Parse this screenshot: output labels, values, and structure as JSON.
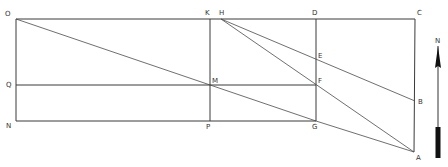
{
  "diagram": {
    "type": "geometric survey diagram",
    "colors": {
      "line": "#3a3a3a",
      "label": "#333333",
      "background": "#ffffff",
      "arrow": "#111111"
    },
    "points": {
      "O": {
        "label": "O",
        "x": 16,
        "y": 19
      },
      "K": {
        "label": "K",
        "x": 210,
        "y": 19
      },
      "H": {
        "label": "H",
        "x": 221,
        "y": 19
      },
      "D": {
        "label": "D",
        "x": 316,
        "y": 19
      },
      "C": {
        "label": "C",
        "x": 415,
        "y": 19
      },
      "E": {
        "label": "E",
        "x": 316,
        "y": 60
      },
      "Q": {
        "label": "Q",
        "x": 16,
        "y": 85
      },
      "M": {
        "label": "M",
        "x": 210,
        "y": 85
      },
      "F": {
        "label": "F",
        "x": 316,
        "y": 85
      },
      "B": {
        "label": "B",
        "x": 415,
        "y": 101
      },
      "N": {
        "label": "N",
        "x": 16,
        "y": 121
      },
      "P": {
        "label": "P",
        "x": 210,
        "y": 121
      },
      "G": {
        "label": "G",
        "x": 316,
        "y": 121
      },
      "A": {
        "label": "A",
        "x": 414,
        "y": 152
      }
    },
    "segments": [
      [
        "O",
        "C"
      ],
      [
        "O",
        "N"
      ],
      [
        "N",
        "G"
      ],
      [
        "Q",
        "F"
      ],
      [
        "K",
        "P"
      ],
      [
        "D",
        "G"
      ],
      [
        "C",
        "A"
      ],
      [
        "O",
        "G"
      ],
      [
        "G",
        "A"
      ],
      [
        "H",
        "A"
      ],
      [
        "H",
        "B"
      ]
    ],
    "north_arrow": {
      "label": "N",
      "x": 438,
      "top": 37,
      "bottom": 162
    }
  }
}
